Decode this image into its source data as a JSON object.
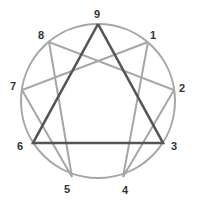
{
  "diagram": {
    "colors": {
      "circle": "#a6a6a6",
      "hexad": "#a6a6a6",
      "triangle": "#555555",
      "label": "#333333"
    },
    "center": [
      98,
      101
    ],
    "radius": 77,
    "points": [
      {
        "label": "9",
        "x": 98,
        "y": 24,
        "lx": 97,
        "ly": 14
      },
      {
        "label": "1",
        "x": 148,
        "y": 42,
        "lx": 153,
        "ly": 35
      },
      {
        "label": "2",
        "x": 174,
        "y": 90,
        "lx": 182,
        "ly": 88
      },
      {
        "label": "3",
        "x": 163,
        "y": 143,
        "lx": 174,
        "ly": 146
      },
      {
        "label": "4",
        "x": 123,
        "y": 177,
        "lx": 125,
        "ly": 190
      },
      {
        "label": "5",
        "x": 72,
        "y": 177,
        "lx": 67,
        "ly": 189
      },
      {
        "label": "6",
        "x": 33,
        "y": 143,
        "lx": 20,
        "ly": 146
      },
      {
        "label": "7",
        "x": 22,
        "y": 90,
        "lx": 13,
        "ly": 86
      },
      {
        "label": "8",
        "x": 49,
        "y": 42,
        "lx": 41,
        "ly": 35
      }
    ],
    "hexad_sequence": [
      "1",
      "4",
      "2",
      "8",
      "5",
      "7",
      "1"
    ],
    "triangle_sequence": [
      "9",
      "3",
      "6",
      "9"
    ]
  }
}
